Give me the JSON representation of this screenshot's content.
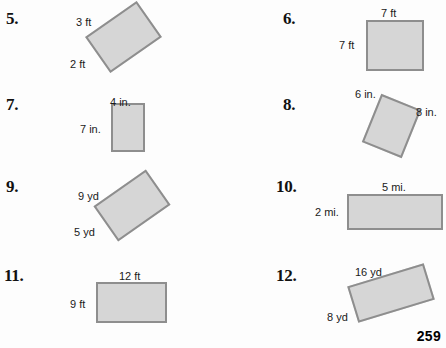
{
  "page": {
    "page_number": "259",
    "background_color": "#fdfdfd",
    "shape_fill_color": "#d6d6d6",
    "shape_border_color": "#8e8e8e"
  },
  "problems": [
    {
      "number": "5.",
      "shape": "rotated-rectangle",
      "labels": {
        "side_a": "3 ft",
        "side_b": "2 ft"
      }
    },
    {
      "number": "6.",
      "shape": "square",
      "labels": {
        "side_a": "7 ft",
        "side_b": "7 ft"
      }
    },
    {
      "number": "7.",
      "shape": "vertical-rectangle",
      "labels": {
        "side_a": "4 in.",
        "side_b": "7 in."
      }
    },
    {
      "number": "8.",
      "shape": "rotated-rectangle",
      "labels": {
        "side_a": "6 in.",
        "side_b": "8 in."
      }
    },
    {
      "number": "9.",
      "shape": "rotated-rectangle",
      "labels": {
        "side_a": "9 yd",
        "side_b": "5 yd"
      }
    },
    {
      "number": "10.",
      "shape": "horizontal-rectangle",
      "labels": {
        "side_a": "5 mi.",
        "side_b": "2 mi."
      }
    },
    {
      "number": "11.",
      "shape": "horizontal-rectangle",
      "labels": {
        "side_a": "12 ft",
        "side_b": "9 ft"
      }
    },
    {
      "number": "12.",
      "shape": "rotated-rectangle",
      "labels": {
        "side_a": "16 yd",
        "side_b": "8 yd"
      }
    }
  ]
}
